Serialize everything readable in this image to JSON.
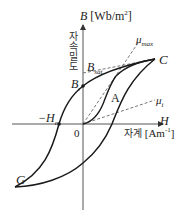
{
  "diagram": {
    "type": "hysteresis-loop",
    "y_axis": {
      "symbol": "B",
      "unit": "[Wb/m",
      "unit_sup": "2",
      "unit_close": "]",
      "korean_label": "자속밀도"
    },
    "x_axis": {
      "symbol": "H",
      "korean_label": "자계",
      "unit": "[Am",
      "unit_sup": "-1",
      "unit_close": "]"
    },
    "points": {
      "origin": "0",
      "C": "C",
      "G": "G",
      "A": "A",
      "Br": {
        "main": "B",
        "sub": "r"
      },
      "Bsat": {
        "main": "B",
        "sub": "sat"
      },
      "negHc": {
        "main": "−H",
        "sub": "c"
      }
    },
    "lines": {
      "mu_max": {
        "main": "μ",
        "sub": "max"
      },
      "mu_i": {
        "main": "μ",
        "sub": "i"
      }
    },
    "colors": {
      "curve": "#1a1a1a",
      "axis": "#555555",
      "dashed": "#666666"
    }
  }
}
